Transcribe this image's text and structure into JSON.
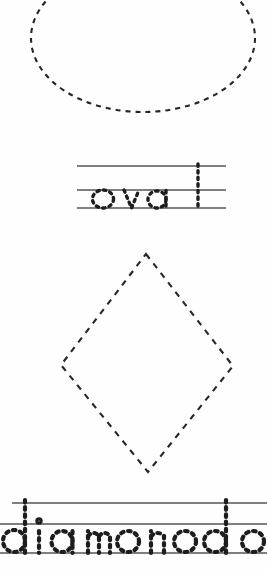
{
  "worksheet": {
    "type": "handwriting-tracing-worksheet",
    "subject": "shapes",
    "width": 267,
    "height": 573,
    "background_color": "#fefefe",
    "ink_color": "#262626",
    "rule_line_color": "#555555"
  },
  "items": [
    {
      "id": "oval",
      "shape_name": "oval",
      "shape": {
        "kind": "ellipse",
        "stroke_style": "dashed",
        "center_x": 143,
        "center_y": 38,
        "radius_x": 112,
        "radius_y": 74,
        "dash_on": 5,
        "dash_off": 5,
        "stroke_width": 2.1,
        "cropped_edges": "top"
      },
      "trace_line": {
        "word": "oval",
        "letter_style": "dotted-outline",
        "left": 77,
        "right": 226,
        "top_rule_y": 166,
        "mid_rule_y": 190,
        "base_rule_y": 208,
        "ascender_letters": "l",
        "x_height_letters": "ova"
      }
    },
    {
      "id": "diamond",
      "shape_name": "diamond",
      "shape": {
        "kind": "rhombus",
        "stroke_style": "dashed",
        "top_x": 146,
        "top_y": 254,
        "right_x": 233,
        "right_y": 366,
        "bottom_x": 148,
        "bottom_y": 472,
        "left_x": 61,
        "left_y": 365,
        "dash_on": 6,
        "dash_off": 6,
        "stroke_width": 2.1,
        "cropped_edges": "none"
      },
      "trace_line": {
        "word": "diamond",
        "letter_style": "dotted-outline",
        "left": 12,
        "right": 267,
        "top_rule_y": 503,
        "mid_rule_y": 524,
        "base_rule_y": 553,
        "ascender_letters": "d",
        "x_height_letters": "iamon",
        "cropped_edges": "left, right, bottom"
      }
    }
  ]
}
